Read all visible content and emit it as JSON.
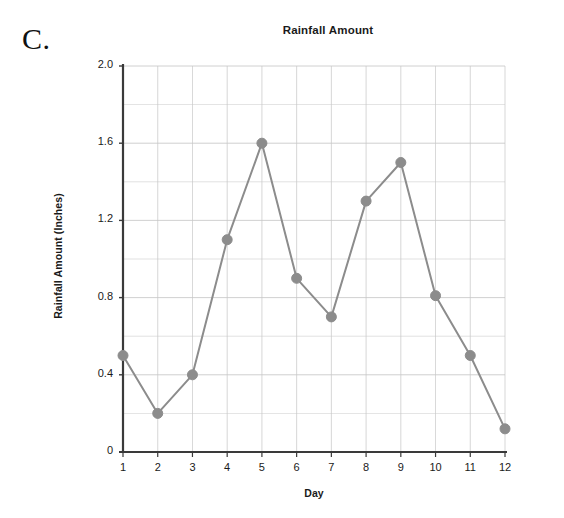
{
  "panel": {
    "letter": "C."
  },
  "chart_data": {
    "type": "line",
    "title": "Rainfall Amount",
    "xlabel": "Day",
    "ylabel": "Rainfall Amount (Inches)",
    "x": [
      1,
      2,
      3,
      4,
      5,
      6,
      7,
      8,
      9,
      10,
      11,
      12
    ],
    "categories": [
      "1",
      "2",
      "3",
      "4",
      "5",
      "6",
      "7",
      "8",
      "9",
      "10",
      "11",
      "12"
    ],
    "values": [
      0.5,
      0.2,
      0.4,
      1.1,
      1.6,
      0.9,
      0.7,
      1.3,
      1.5,
      0.81,
      0.5,
      0.12
    ],
    "series": [
      {
        "name": "Rainfall Amount",
        "values": [
          0.5,
          0.2,
          0.4,
          1.1,
          1.6,
          0.9,
          0.7,
          1.3,
          1.5,
          0.81,
          0.5,
          0.12
        ]
      }
    ],
    "ylim": [
      0,
      2.0
    ],
    "xlim": [
      1,
      12
    ],
    "ytick_labels": [
      "2.0",
      "1.6",
      "1.2",
      "0.8",
      "0.4",
      "0"
    ],
    "ytick_values": [
      2.0,
      1.6,
      1.2,
      0.8,
      0.4,
      0
    ],
    "y_minor_step": 0.2,
    "xtick_labels": [
      "1",
      "2",
      "3",
      "4",
      "5",
      "6",
      "7",
      "8",
      "9",
      "10",
      "11",
      "12"
    ],
    "grid": true,
    "legend": false,
    "legend_position": "none",
    "line_color": "#8c8c8c",
    "marker_color": "#8c8c8c",
    "marker_shape": "circle",
    "grid_color": "#c8c8c8",
    "axis_color": "#3a3a3a",
    "background_color": "#ffffff"
  }
}
